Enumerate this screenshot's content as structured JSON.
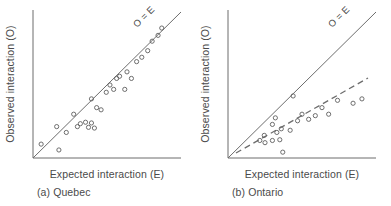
{
  "figure": {
    "panels": [
      {
        "id": "quebec",
        "caption": "(a) Quebec",
        "xlabel": "Expected interaction (E)",
        "ylabel": "Observed interaction (O)",
        "line_label": "O = E"
      },
      {
        "id": "ontario",
        "caption": "(b) Ontario",
        "xlabel": "Expected interaction (E)",
        "ylabel": "Observed interaction (O)",
        "line_label": "O = E"
      }
    ]
  },
  "colors": {
    "axis": "#6d6d6d",
    "marker": "#5f5f5f",
    "text": "#4a4a4a",
    "background": "#ffffff"
  },
  "chart_data": [
    {
      "type": "scatter",
      "title": "(a) Quebec",
      "xlabel": "Expected interaction (E)",
      "ylabel": "Observed interaction (O)",
      "xlim": [
        0,
        1
      ],
      "ylim": [
        0,
        1
      ],
      "grid": false,
      "legend": false,
      "annotations": [
        {
          "text": "O = E",
          "x": 0.73,
          "y": 0.88,
          "rotation": -42
        }
      ],
      "reference_lines": [
        {
          "name": "identity",
          "style": "solid",
          "label": "O = E",
          "x": [
            0.0,
            1.0
          ],
          "y": [
            0.0,
            1.0
          ]
        }
      ],
      "points": [
        {
          "x": 0.055,
          "y": 0.095
        },
        {
          "x": 0.175,
          "y": 0.055
        },
        {
          "x": 0.16,
          "y": 0.215
        },
        {
          "x": 0.225,
          "y": 0.175
        },
        {
          "x": 0.275,
          "y": 0.3
        },
        {
          "x": 0.3,
          "y": 0.215
        },
        {
          "x": 0.32,
          "y": 0.235
        },
        {
          "x": 0.355,
          "y": 0.245
        },
        {
          "x": 0.375,
          "y": 0.21
        },
        {
          "x": 0.395,
          "y": 0.24
        },
        {
          "x": 0.415,
          "y": 0.205
        },
        {
          "x": 0.395,
          "y": 0.405
        },
        {
          "x": 0.43,
          "y": 0.345
        },
        {
          "x": 0.46,
          "y": 0.33
        },
        {
          "x": 0.495,
          "y": 0.45
        },
        {
          "x": 0.52,
          "y": 0.5
        },
        {
          "x": 0.545,
          "y": 0.47
        },
        {
          "x": 0.565,
          "y": 0.545
        },
        {
          "x": 0.585,
          "y": 0.56
        },
        {
          "x": 0.62,
          "y": 0.47
        },
        {
          "x": 0.635,
          "y": 0.59
        },
        {
          "x": 0.665,
          "y": 0.545
        },
        {
          "x": 0.7,
          "y": 0.66
        },
        {
          "x": 0.735,
          "y": 0.69
        },
        {
          "x": 0.775,
          "y": 0.735
        },
        {
          "x": 0.805,
          "y": 0.8
        },
        {
          "x": 0.845,
          "y": 0.84
        },
        {
          "x": 0.87,
          "y": 0.89
        }
      ],
      "n_points": 28,
      "description": "Observed values track the O = E identity line closely with small scatter."
    },
    {
      "type": "scatter",
      "title": "(b) Ontario",
      "xlabel": "Expected interaction (E)",
      "ylabel": "Observed interaction (O)",
      "xlim": [
        0,
        1
      ],
      "ylim": [
        0,
        1
      ],
      "grid": false,
      "legend": false,
      "annotations": [
        {
          "text": "O = E",
          "x": 0.73,
          "y": 0.88,
          "rotation": -42
        }
      ],
      "reference_lines": [
        {
          "name": "identity",
          "style": "solid",
          "label": "O = E",
          "x": [
            0.0,
            1.0
          ],
          "y": [
            0.0,
            1.0
          ]
        },
        {
          "name": "fit",
          "style": "dashed",
          "label": "",
          "x": [
            0.055,
            0.945
          ],
          "y": [
            0.035,
            0.545
          ]
        }
      ],
      "points": [
        {
          "x": 0.215,
          "y": 0.12
        },
        {
          "x": 0.245,
          "y": 0.155
        },
        {
          "x": 0.25,
          "y": 0.105
        },
        {
          "x": 0.3,
          "y": 0.12
        },
        {
          "x": 0.3,
          "y": 0.23
        },
        {
          "x": 0.32,
          "y": 0.275
        },
        {
          "x": 0.33,
          "y": 0.175
        },
        {
          "x": 0.35,
          "y": 0.125
        },
        {
          "x": 0.36,
          "y": 0.2
        },
        {
          "x": 0.37,
          "y": 0.04
        },
        {
          "x": 0.42,
          "y": 0.19
        },
        {
          "x": 0.44,
          "y": 0.425
        },
        {
          "x": 0.47,
          "y": 0.255
        },
        {
          "x": 0.5,
          "y": 0.3
        },
        {
          "x": 0.545,
          "y": 0.265
        },
        {
          "x": 0.59,
          "y": 0.29
        },
        {
          "x": 0.635,
          "y": 0.345
        },
        {
          "x": 0.68,
          "y": 0.3
        },
        {
          "x": 0.74,
          "y": 0.395
        },
        {
          "x": 0.845,
          "y": 0.375
        },
        {
          "x": 0.905,
          "y": 0.405
        }
      ],
      "n_points": 21,
      "description": "Observed values fall systematically below the O = E identity line; dashed fit line has a shallower slope."
    }
  ]
}
